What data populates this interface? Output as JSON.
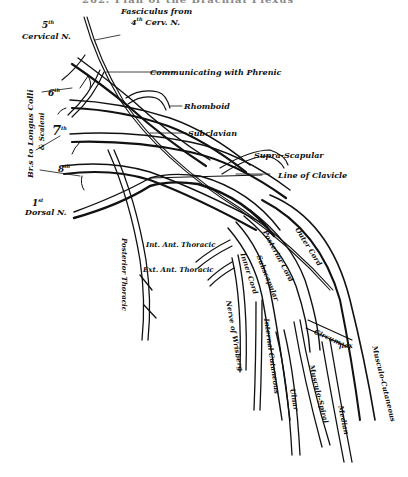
{
  "header": {
    "text": "262.  Plan of the Brachial Plexus"
  },
  "figure": {
    "type": "anatomical-diagram",
    "subject": "brachial plexus",
    "roots": [
      {
        "number": "5",
        "suffix": "th",
        "label": "Cervical N."
      },
      {
        "number": "6",
        "suffix": "th"
      },
      {
        "number": "7",
        "suffix": "th"
      },
      {
        "number": "8",
        "suffix": "th"
      },
      {
        "number": "1",
        "suffix": "st",
        "label": "Dorsal N."
      }
    ],
    "labels": {
      "fasciculus_line1": "Fasciculus from",
      "fasciculus_num": "4",
      "fasciculus_suffix": "th",
      "fasciculus_line2": "Cerv. N.",
      "communicating": "Communicating with Phrenic",
      "rhomboid": "Rhomboid",
      "subclavian": "Subclavian",
      "supra_scapular": "Supra-Scapular",
      "line_of_clavicle": "Line of Clavicle",
      "longus_colli_line1": "Br.s to Longus Colli",
      "longus_colli_line2": "& Scaleni",
      "posterior_thoracic": "Posterior Thoracic",
      "int_ant_thoracic": "Int. Ant. Thoracic",
      "ext_ant_thoracic": "Ext. Ant. Thoracic",
      "outer_cord": "Outer Cord",
      "posterior_cord": "Posterior Cord",
      "subscapular": "Subscapular",
      "inner_cord": "Inner Cord",
      "nerve_of_wrisberg": "Nerve of Wrisberg",
      "internal_cutaneous": "Internal Cutaneous",
      "ulnar": "Ulnar",
      "musculo_spiral": "Musculo-Spiral",
      "median": "Median",
      "circumflex_a": "Circum",
      "circumflex_b": "flex",
      "musculo_cutaneous": "Musculo-Cutaneous"
    }
  }
}
